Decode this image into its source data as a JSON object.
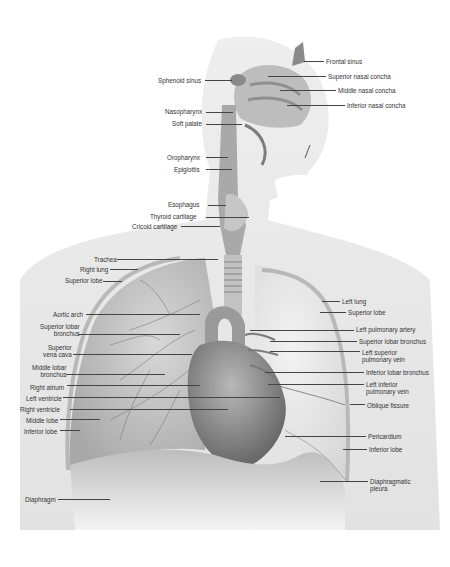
{
  "figure": {
    "colors": {
      "background": "#ffffff",
      "body_silhouette": "#e6e6e6",
      "lung": "#c9c9c9",
      "lung_light": "#dedede",
      "heart": "#8a8a8a",
      "diaphragm": "#b4b4b4",
      "label_text": "#333333",
      "leader_line": "#444444"
    },
    "labels_left": [
      {
        "id": "sphenoid-sinus",
        "text": [
          "Sphenoid sinus"
        ],
        "x": 158,
        "y": 77,
        "lx1": 205,
        "lx2": 232,
        "ly": 80
      },
      {
        "id": "nasopharynx",
        "text": [
          "Nasopharynx"
        ],
        "x": 165,
        "y": 108,
        "lx1": 206,
        "lx2": 233,
        "ly": 112
      },
      {
        "id": "soft-palate",
        "text": [
          "Soft palate"
        ],
        "x": 172,
        "y": 120,
        "lx1": 206,
        "lx2": 242,
        "ly": 124
      },
      {
        "id": "oropharynx",
        "text": [
          "Oropharynx"
        ],
        "x": 167,
        "y": 154,
        "lx1": 206,
        "lx2": 228,
        "ly": 157
      },
      {
        "id": "epiglottis",
        "text": [
          "Epiglottis"
        ],
        "x": 174,
        "y": 166,
        "lx1": 206,
        "lx2": 232,
        "ly": 169
      },
      {
        "id": "esophagus",
        "text": [
          "Esophagus"
        ],
        "x": 168,
        "y": 201,
        "lx1": 208,
        "lx2": 226,
        "ly": 205
      },
      {
        "id": "thyroid-cartilage",
        "text": [
          "Thyroid cartilage"
        ],
        "x": 150,
        "y": 213,
        "lx1": 206,
        "lx2": 249,
        "ly": 217
      },
      {
        "id": "cricoid-cartilage",
        "text": [
          "Cricoid cartilage"
        ],
        "x": 132,
        "y": 223,
        "lx1": 181,
        "lx2": 220,
        "ly": 226
      },
      {
        "id": "trachea",
        "text": [
          "Trachea"
        ],
        "x": 94,
        "y": 256,
        "lx1": 117,
        "lx2": 218,
        "ly": 259
      },
      {
        "id": "right-lung",
        "text": [
          "Right lung"
        ],
        "x": 80,
        "y": 266,
        "lx1": 110,
        "lx2": 138,
        "ly": 269
      },
      {
        "id": "superior-lobe-right",
        "text": [
          "Superior lobe"
        ],
        "x": 65,
        "y": 277,
        "lx1": 103,
        "lx2": 122,
        "ly": 281
      },
      {
        "id": "aortic-arch",
        "text": [
          "Aortic arch"
        ],
        "x": 53,
        "y": 311,
        "lx1": 86,
        "lx2": 200,
        "ly": 314
      },
      {
        "id": "superior-lobar-bronchus-right",
        "text": [
          "Superior lobar",
          "bronchus"
        ],
        "x": 40,
        "y": 323,
        "lx1": 78,
        "lx2": 180,
        "ly": 334
      },
      {
        "id": "superior-vena-cava",
        "text": [
          "Superior",
          "vena cava"
        ],
        "x": 43,
        "y": 344,
        "lx1": 73,
        "lx2": 192,
        "ly": 354
      },
      {
        "id": "middle-lobar-bronchus",
        "text": [
          "Middle lobar",
          "bronchus"
        ],
        "x": 32,
        "y": 364,
        "lx1": 66,
        "lx2": 165,
        "ly": 374
      },
      {
        "id": "right-atrium",
        "text": [
          "Right atrium"
        ],
        "x": 30,
        "y": 384,
        "lx1": 67,
        "lx2": 200,
        "ly": 385
      },
      {
        "id": "left-ventricle",
        "text": [
          "Left ventricle"
        ],
        "x": 26,
        "y": 395,
        "lx1": 63,
        "lx2": 280,
        "ly": 397
      },
      {
        "id": "right-ventricle",
        "text": [
          "Right ventricle"
        ],
        "x": 20,
        "y": 406,
        "lx1": 70,
        "lx2": 228,
        "ly": 409
      },
      {
        "id": "middle-lobe",
        "text": [
          "Middle lobe"
        ],
        "x": 26,
        "y": 417,
        "lx1": 60,
        "lx2": 100,
        "ly": 419
      },
      {
        "id": "inferior-lobe-right",
        "text": [
          "Inferior lobe"
        ],
        "x": 24,
        "y": 428,
        "lx1": 60,
        "lx2": 80,
        "ly": 430
      },
      {
        "id": "diaphragm",
        "text": [
          "Diaphragm"
        ],
        "x": 25,
        "y": 496,
        "lx1": 58,
        "lx2": 110,
        "ly": 499
      }
    ],
    "labels_right": [
      {
        "id": "frontal-sinus",
        "text": [
          "Frontal sinus"
        ],
        "x": 326,
        "y": 58,
        "lx1": 304,
        "lx2": 324,
        "ly": 61
      },
      {
        "id": "superior-nasal-concha",
        "text": [
          "Superior nasal concha"
        ],
        "x": 328,
        "y": 73,
        "lx1": 268,
        "lx2": 326,
        "ly": 76
      },
      {
        "id": "middle-nasal-concha",
        "text": [
          "Middle nasal concha"
        ],
        "x": 338,
        "y": 87,
        "lx1": 280,
        "lx2": 336,
        "ly": 90
      },
      {
        "id": "inferior-nasal-concha",
        "text": [
          "Inferior nasal concha"
        ],
        "x": 347,
        "y": 102,
        "lx1": 287,
        "lx2": 345,
        "ly": 105
      },
      {
        "id": "left-lung",
        "text": [
          "Left lung"
        ],
        "x": 342,
        "y": 298,
        "lx1": 322,
        "lx2": 340,
        "ly": 301
      },
      {
        "id": "superior-lobe-left",
        "text": [
          "Superior lobe"
        ],
        "x": 348,
        "y": 309,
        "lx1": 320,
        "lx2": 346,
        "ly": 312
      },
      {
        "id": "left-pulmonary-artery",
        "text": [
          "Left pulmonary artery"
        ],
        "x": 356,
        "y": 326,
        "lx1": 250,
        "lx2": 354,
        "ly": 330
      },
      {
        "id": "superior-lobar-bronchus-left",
        "text": [
          "Superior lobar bronchus"
        ],
        "x": 359,
        "y": 338,
        "lx1": 270,
        "lx2": 357,
        "ly": 341
      },
      {
        "id": "left-superior-pulmonary-vein",
        "text": [
          "Left superior",
          "pulmonary vein"
        ],
        "x": 362,
        "y": 349,
        "lx1": 270,
        "lx2": 360,
        "ly": 351
      },
      {
        "id": "inferior-lobar-bronchus",
        "text": [
          "Inferior lobar bronchus"
        ],
        "x": 366,
        "y": 369,
        "lx1": 265,
        "lx2": 364,
        "ly": 372
      },
      {
        "id": "left-inferior-pulmonary-vein",
        "text": [
          "Left inferior",
          "pulmonary vein"
        ],
        "x": 366,
        "y": 381,
        "lx1": 268,
        "lx2": 364,
        "ly": 384
      },
      {
        "id": "oblique-fissure",
        "text": [
          "Oblique fissure"
        ],
        "x": 367,
        "y": 402,
        "lx1": 350,
        "lx2": 365,
        "ly": 404
      },
      {
        "id": "pericardium",
        "text": [
          "Pericardium"
        ],
        "x": 368,
        "y": 433,
        "lx1": 285,
        "lx2": 366,
        "ly": 436
      },
      {
        "id": "inferior-lobe-left",
        "text": [
          "Inferior lobe"
        ],
        "x": 369,
        "y": 446,
        "lx1": 343,
        "lx2": 367,
        "ly": 449
      },
      {
        "id": "diaphragmatic-pleura",
        "text": [
          "Diaphragmatic",
          "pleura"
        ],
        "x": 370,
        "y": 478,
        "lx1": 320,
        "lx2": 368,
        "ly": 481
      }
    ]
  }
}
